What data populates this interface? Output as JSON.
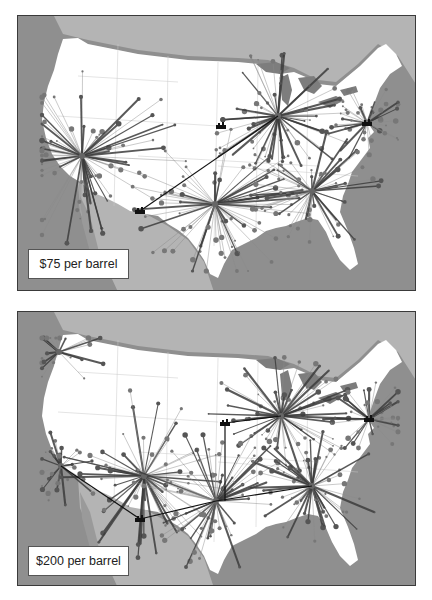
{
  "figure": {
    "panels": [
      {
        "id": "top",
        "label": "$75 per barrel",
        "hubs": [
          {
            "name": "west",
            "x": 64,
            "y": 140,
            "spokes": 70,
            "reach": 95
          },
          {
            "name": "chicago",
            "x": 260,
            "y": 100,
            "spokes": 60,
            "reach": 70
          },
          {
            "name": "northeast",
            "x": 349,
            "y": 107,
            "spokes": 40,
            "reach": 45
          },
          {
            "name": "texas",
            "x": 197,
            "y": 188,
            "spokes": 70,
            "reach": 85
          },
          {
            "name": "southeast",
            "x": 294,
            "y": 175,
            "spokes": 55,
            "reach": 65
          }
        ],
        "factories": [
          {
            "x": 203,
            "y": 110
          },
          {
            "x": 122,
            "y": 195
          },
          {
            "x": 349,
            "y": 107
          }
        ],
        "links": [
          {
            "from": [
              122,
              195
            ],
            "to": [
              260,
              100
            ]
          }
        ]
      },
      {
        "id": "bottom",
        "label": "$200 per barrel",
        "hubs": [
          {
            "name": "northwest",
            "x": 41,
            "y": 40,
            "spokes": 25,
            "reach": 45
          },
          {
            "name": "california",
            "x": 43,
            "y": 154,
            "spokes": 30,
            "reach": 45
          },
          {
            "name": "mountain",
            "x": 126,
            "y": 164,
            "spokes": 60,
            "reach": 95
          },
          {
            "name": "texas",
            "x": 198,
            "y": 189,
            "spokes": 60,
            "reach": 80
          },
          {
            "name": "chicago",
            "x": 263,
            "y": 104,
            "spokes": 60,
            "reach": 70
          },
          {
            "name": "southeast",
            "x": 294,
            "y": 174,
            "spokes": 55,
            "reach": 65
          },
          {
            "name": "northeast",
            "x": 351,
            "y": 107,
            "spokes": 40,
            "reach": 45
          }
        ],
        "factories": [
          {
            "x": 122,
            "y": 207
          },
          {
            "x": 207,
            "y": 111
          },
          {
            "x": 351,
            "y": 107
          }
        ],
        "links": [
          {
            "from": [
              43,
              154
            ],
            "to": [
              122,
              207
            ]
          },
          {
            "from": [
              122,
              207
            ],
            "to": [
              198,
              189
            ]
          },
          {
            "from": [
              198,
              189
            ],
            "to": [
              294,
              174
            ]
          },
          {
            "from": [
              207,
              111
            ],
            "to": [
              263,
              104
            ]
          },
          {
            "from": [
              207,
              111
            ],
            "to": [
              207,
              189
            ]
          }
        ]
      }
    ],
    "colors": {
      "ocean": "#8f8f8f",
      "land_foreign": "#b4b4b4",
      "usa": "#ffffff",
      "lakes": "#7d7d7d",
      "spoke_dark": "#3c3c3c",
      "spoke_light": "#8a8a8a",
      "link": "#111111"
    }
  }
}
